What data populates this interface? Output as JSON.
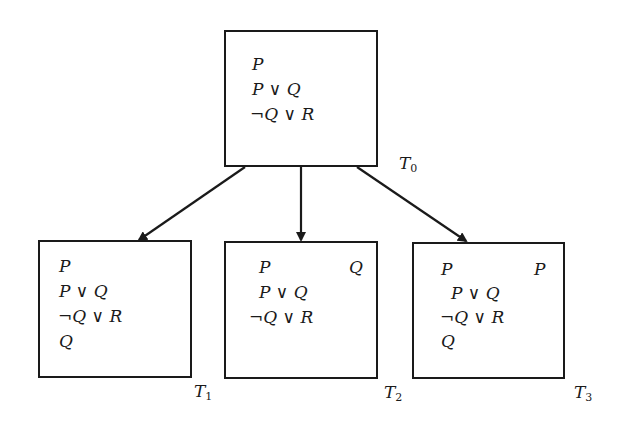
{
  "diagram": {
    "nodes": [
      {
        "id": "T0",
        "label": "T",
        "label_sub": "0",
        "left_formulas": [
          "P",
          "P ∨ Q",
          "¬Q ∨ R"
        ],
        "right_formulas": []
      },
      {
        "id": "T1",
        "label": "T",
        "label_sub": "1",
        "left_formulas": [
          "P",
          "P ∨ Q",
          "¬Q ∨ R",
          "Q"
        ],
        "right_formulas": []
      },
      {
        "id": "T2",
        "label": "T",
        "label_sub": "2",
        "left_formulas": [
          "P",
          "P ∨ Q",
          "¬Q ∨ R"
        ],
        "right_formulas": [
          "Q"
        ]
      },
      {
        "id": "T3",
        "label": "T",
        "label_sub": "3",
        "left_formulas": [
          "P",
          "P ∨ Q",
          "¬Q ∨ R",
          "Q"
        ],
        "right_formulas": [
          "P"
        ]
      }
    ],
    "edges": [
      {
        "from": "T0",
        "to": "T1"
      },
      {
        "from": "T0",
        "to": "T2"
      },
      {
        "from": "T0",
        "to": "T3"
      }
    ],
    "colors": {
      "stroke": "#1a1a1a",
      "background": "#ffffff"
    }
  }
}
